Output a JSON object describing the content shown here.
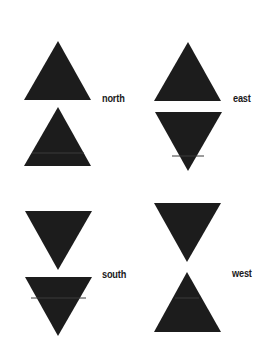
{
  "diagram": {
    "fill_color": "#1c1c1c",
    "background": "#ffffff",
    "groups": [
      {
        "label": "north",
        "label_pos": {
          "x": 102,
          "y": 94
        },
        "triangles": [
          {
            "direction": "up",
            "points": "58,41 24,100 91,100"
          },
          {
            "direction": "up",
            "points": "58,107 24,166 91,166"
          }
        ]
      },
      {
        "label": "east",
        "label_pos": {
          "x": 233,
          "y": 94
        },
        "triangles": [
          {
            "direction": "up",
            "points": "188,42 154,101 221,101"
          },
          {
            "direction": "down",
            "points": "155,112 222,112 188,171"
          }
        ]
      },
      {
        "label": "south",
        "label_pos": {
          "x": 102,
          "y": 270
        },
        "triangles": [
          {
            "direction": "down",
            "points": "25,211 92,211 58,270"
          },
          {
            "direction": "down",
            "points": "25,277 92,277 58,336"
          }
        ]
      },
      {
        "label": "west",
        "label_pos": {
          "x": 232,
          "y": 269
        },
        "triangles": [
          {
            "direction": "down",
            "points": "154,203 221,203 187,262"
          },
          {
            "direction": "up",
            "points": "187,272 154,332 221,332"
          }
        ]
      }
    ]
  }
}
